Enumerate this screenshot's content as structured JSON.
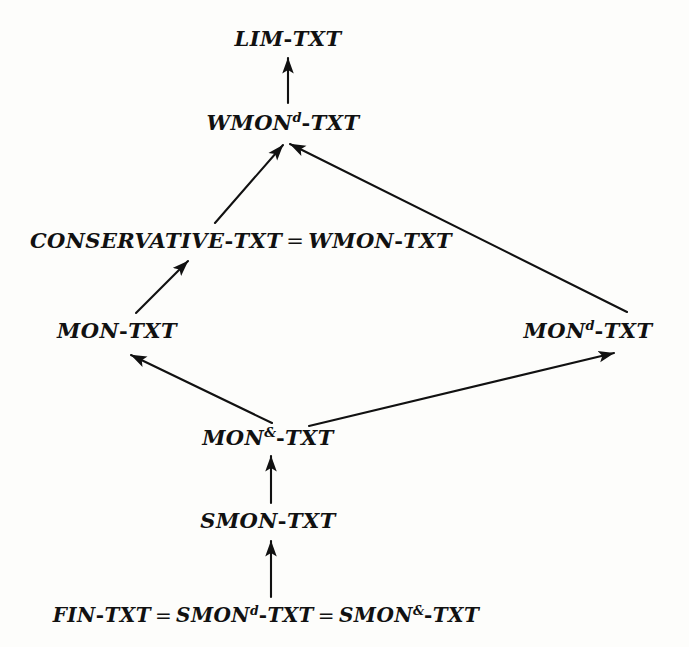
{
  "diagram": {
    "type": "hasse-lattice",
    "background_color": "#fdfdfb",
    "ink_color": "#111111",
    "nodes": [
      {
        "id": "lim",
        "label": "LIM-TXT",
        "base": "LIM",
        "superscript": "",
        "x": 288,
        "y": 38
      },
      {
        "id": "wmond",
        "label": "WMON^d-TXT",
        "base": "WMON",
        "superscript": "d",
        "x": 283,
        "y": 122
      },
      {
        "id": "cons",
        "label": "CONSERVATIVE-TXT = WMON-TXT",
        "base": "CONSERVATIVE",
        "superscript": "",
        "x": 241,
        "y": 240
      },
      {
        "id": "mon",
        "label": "MON-TXT",
        "base": "MON",
        "superscript": "",
        "x": 117,
        "y": 330
      },
      {
        "id": "mond",
        "label": "MON^d-TXT",
        "base": "MON",
        "superscript": "d",
        "x": 588,
        "y": 330
      },
      {
        "id": "monamp",
        "label": "MON^&-TXT",
        "base": "MON",
        "superscript": "&",
        "x": 268,
        "y": 437
      },
      {
        "id": "smon",
        "label": "SMON-TXT",
        "base": "SMON",
        "superscript": "",
        "x": 268,
        "y": 520
      },
      {
        "id": "fin",
        "label": "FIN-TXT = SMON^d-TXT = SMON^&-TXT",
        "base": "FIN",
        "superscript": "",
        "x": 266,
        "y": 615
      }
    ],
    "node_text": {
      "lim": {
        "p1": "LIM",
        "dash1": "-",
        "p2": "TXT"
      },
      "wmond": {
        "p1": "WMON",
        "sup": "d",
        "dash1": "-",
        "p2": "TXT"
      },
      "cons": {
        "p1": "CONSERVATIVE",
        "dash1": "-",
        "p2": "TXT",
        "eq": "=",
        "p3": "WMON",
        "dash2": "-",
        "p4": "TXT"
      },
      "mon": {
        "p1": "MON",
        "dash1": "-",
        "p2": "TXT"
      },
      "mond": {
        "p1": "MON",
        "sup": "d",
        "dash1": "-",
        "p2": "TXT"
      },
      "monamp": {
        "p1": "MON",
        "sup": "&",
        "dash1": "-",
        "p2": "TXT"
      },
      "smon": {
        "p1": "SMON",
        "dash1": "-",
        "p2": "TXT"
      },
      "fin": {
        "p1": "FIN",
        "dash1": "-",
        "p2": "TXT",
        "eq1": "=",
        "p3": "SMON",
        "sup1": "d",
        "dash2": "-",
        "p4": "TXT",
        "eq2": "=",
        "p5": "SMON",
        "sup2": "&",
        "dash3": "-",
        "p6": "TXT"
      }
    },
    "edges": [
      {
        "id": "e1",
        "from": "wmond",
        "to": "lim",
        "x1": 288,
        "y1": 103,
        "x2": 288,
        "y2": 58,
        "arrow": true
      },
      {
        "id": "e2",
        "from": "cons",
        "to": "wmond",
        "x1": 215,
        "y1": 223,
        "x2": 283,
        "y2": 145,
        "arrow": true
      },
      {
        "id": "e3",
        "from": "mond",
        "to": "wmond",
        "x1": 627,
        "y1": 312,
        "x2": 290,
        "y2": 144,
        "arrow": true
      },
      {
        "id": "e4",
        "from": "mon",
        "to": "cons",
        "x1": 136,
        "y1": 313,
        "x2": 188,
        "y2": 261,
        "arrow": true
      },
      {
        "id": "e5",
        "from": "monamp",
        "to": "mon",
        "x1": 272,
        "y1": 423,
        "x2": 131,
        "y2": 355,
        "arrow": true
      },
      {
        "id": "e6",
        "from": "monamp",
        "to": "mond",
        "x1": 309,
        "y1": 426,
        "x2": 614,
        "y2": 353,
        "arrow": true
      },
      {
        "id": "e7",
        "from": "smon",
        "to": "monamp",
        "x1": 271,
        "y1": 503,
        "x2": 271,
        "y2": 456,
        "arrow": true
      },
      {
        "id": "e8",
        "from": "fin",
        "to": "smon",
        "x1": 271,
        "y1": 597,
        "x2": 271,
        "y2": 541,
        "arrow": true
      }
    ]
  }
}
